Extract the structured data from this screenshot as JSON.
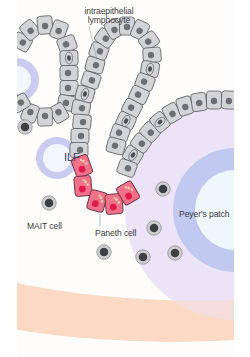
{
  "figure": {
    "type": "biological-schematic"
  },
  "labels": {
    "intraepithelial_lymphocyte": "intraepithelial\nlymphocyte",
    "intraepithelial_line1": "intraepithelial",
    "intraepithelial_line2": "lymphocyte",
    "ilf": "ILF",
    "mait_cell": "MAIT cell",
    "paneth_cell": "Paneth cell",
    "peyers_patch": "Peyer's patch"
  },
  "colors": {
    "background": "#fefdfb",
    "epithelial_cell_fill": "#d3d4d8",
    "epithelial_cell_stroke": "#5c5d62",
    "nucleus": "#6e6f74",
    "paneth_cell_fill": "#f0728a",
    "paneth_cell_stroke": "#6a3040",
    "paneth_nucleus": "#e01a4a",
    "paneth_granule": "#f5d0a8",
    "ilf_ring": "#c9ccf0",
    "ilf_center": "#f2f6ff",
    "peyers_outer": "#ece3f8",
    "peyers_ring": "#c2c9f1",
    "peyers_center": "#eef8fc",
    "lamina_propria_band": "#fbd8c2",
    "immune_cell_outer": "#cfcfd1",
    "immune_cell_nucleus": "#3f4043",
    "leader_line": "#6a9a9a"
  },
  "elements": {
    "free_immune_cells_count": 8,
    "paneth_cells_count": 5
  }
}
